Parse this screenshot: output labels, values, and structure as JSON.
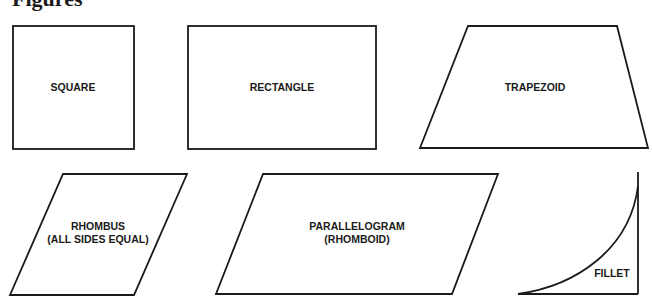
{
  "title": "Figures",
  "shapes": {
    "square": {
      "label": "SQUARE"
    },
    "rectangle": {
      "label": "RECTANGLE"
    },
    "trapezoid": {
      "label": "TRAPEZOID"
    },
    "rhombus": {
      "label_line1": "RHOMBUS",
      "label_line2": "(ALL SIDES EQUAL)"
    },
    "parallelogram": {
      "label_line1": "PARALLELOGRAM",
      "label_line2": "(RHOMBOID)"
    },
    "fillet": {
      "label": "FILLET"
    }
  },
  "colors": {
    "stroke": "#1a1a1a",
    "background": "#ffffff"
  }
}
